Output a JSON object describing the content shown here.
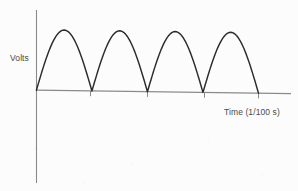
{
  "chart_data": {
    "type": "line",
    "title": "",
    "subtitle": "",
    "xlabel": "Time (1/100 s)",
    "ylabel": "Volts",
    "grid": false,
    "legend": null,
    "waveform": "full-wave rectified sine (absolute value of sine)",
    "cycles": 4,
    "period_units": 1,
    "peak_amplitude": 1,
    "xlim": [
      0,
      4.5
    ],
    "ylim": [
      0,
      1.15
    ],
    "x_tick_values": [
      1,
      2,
      3,
      4
    ],
    "x_tick_labels": [
      "",
      "",
      "",
      ""
    ],
    "y_tick_values": [],
    "y_tick_labels": [],
    "series": [
      {
        "name": "rectified sine",
        "color": "#2b2b2b",
        "x": [
          0,
          0.1,
          0.2,
          0.3,
          0.4,
          0.5,
          0.6,
          0.7,
          0.8,
          0.9,
          1.0,
          1.1,
          1.2,
          1.3,
          1.4,
          1.5,
          1.6,
          1.7,
          1.8,
          1.9,
          2.0,
          2.1,
          2.2,
          2.3,
          2.4,
          2.5,
          2.6,
          2.7,
          2.8,
          2.9,
          3.0,
          3.1,
          3.2,
          3.3,
          3.4,
          3.5,
          3.6,
          3.7,
          3.8,
          3.9,
          4.0
        ],
        "y": [
          0,
          0.309,
          0.588,
          0.809,
          0.951,
          1.0,
          0.951,
          0.809,
          0.588,
          0.309,
          0,
          0.309,
          0.588,
          0.809,
          0.951,
          1.0,
          0.951,
          0.809,
          0.588,
          0.309,
          0,
          0.309,
          0.588,
          0.809,
          0.951,
          1.0,
          0.951,
          0.809,
          0.588,
          0.309,
          0,
          0.309,
          0.588,
          0.809,
          0.951,
          1.0,
          0.951,
          0.809,
          0.588,
          0.309,
          0
        ]
      }
    ],
    "peaks": [
      {
        "x": 0.5,
        "y": 1.0
      },
      {
        "x": 1.5,
        "y": 1.0
      },
      {
        "x": 2.5,
        "y": 1.0
      },
      {
        "x": 3.5,
        "y": 1.0
      }
    ],
    "zero_crossings": [
      0,
      1,
      2,
      3,
      4
    ],
    "colors": {
      "curve": "#2b2b2b",
      "axis": "#8a8a8a",
      "label_text": "#4a4a4a",
      "background": "#fcfcfc"
    }
  },
  "figure": {
    "ylabel": "Volts",
    "xlabel": "Time (1/100 s)"
  }
}
